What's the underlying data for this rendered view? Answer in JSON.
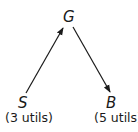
{
  "nodes": {
    "G": {
      "label": "G"
    },
    "S": {
      "label": "S",
      "value": "(3 utils)"
    },
    "B": {
      "label": "B",
      "value": "(5 utils)"
    }
  },
  "edges": [
    {
      "from": "S",
      "to": "G"
    },
    {
      "from": "G",
      "to": "B"
    }
  ]
}
